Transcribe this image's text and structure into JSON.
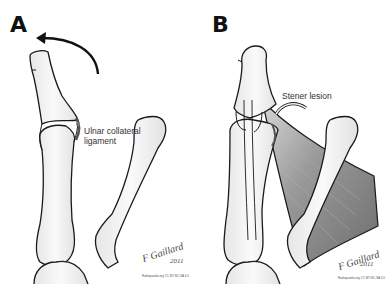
{
  "figure": {
    "panels": [
      {
        "label": "A",
        "annotation": "Ulnar collateral ligament",
        "annotation_lines": [
          "Ulnar collateral",
          "ligament"
        ],
        "signature": "F Gaillard",
        "signature_year": "2011",
        "credit": "Radiopaedia.org CC BY-NC-SA 4.0"
      },
      {
        "label": "B",
        "annotation": "Stener lesion",
        "signature": "F Gaillard",
        "signature_year": "2011",
        "credit": "Radiopaedia.org CC BY-NC-SA 4.0"
      }
    ],
    "colors": {
      "outline": "#1a1a1a",
      "bone_fill": "#f4f4f4",
      "muscle_fill": "#8a8a8a",
      "background": "#ffffff"
    }
  }
}
